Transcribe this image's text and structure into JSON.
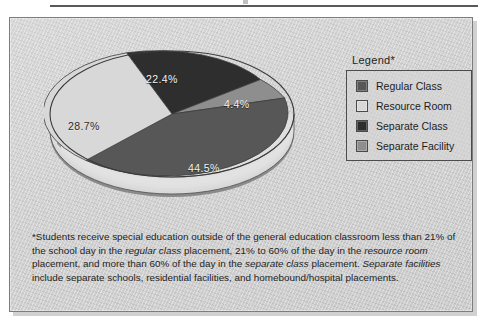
{
  "figure": {
    "legend_title": "Legend*",
    "caption_segments": [
      {
        "text": "*Students receive special education outside of the general education classroom less than 21% of the school day in the ",
        "italic": false
      },
      {
        "text": "regular class",
        "italic": true
      },
      {
        "text": " placement, 21% to 60% of the day in the ",
        "italic": false
      },
      {
        "text": "resource room",
        "italic": true
      },
      {
        "text": " placement, and more than 60% of the day in the ",
        "italic": false
      },
      {
        "text": "separate class",
        "italic": true
      },
      {
        "text": " placement. ",
        "italic": false
      },
      {
        "text": "Separate facilities",
        "italic": true
      },
      {
        "text": " include separate schools, residential facilities, and homebound/hospital placements.",
        "italic": false
      }
    ]
  },
  "chart_data": {
    "type": "pie",
    "title": "",
    "categories": [
      "Regular Class",
      "Resource Room",
      "Separate Class",
      "Separate Facility"
    ],
    "values": [
      44.5,
      28.7,
      22.4,
      4.4
    ],
    "value_labels": [
      "44.5%",
      "28.7%",
      "22.4%",
      "4.4%"
    ],
    "colors": [
      "#575757",
      "#d8d8d8",
      "#2e2e2e",
      "#8e8e8e"
    ],
    "label_text_colors": [
      "#f2f2f2",
      "#2b2b2b",
      "#f2f2f2",
      "#e8e8e8"
    ],
    "legend": [
      "Regular Class",
      "Resource Room",
      "Separate Class",
      "Separate Facility"
    ],
    "legend_position": "right",
    "three_d": true,
    "grid": false,
    "units": "percent"
  },
  "legend_items": [
    {
      "label": "Regular Class",
      "color": "#575757"
    },
    {
      "label": "Resource Room",
      "color": "#d8d8d8"
    },
    {
      "label": "Separate Class",
      "color": "#2e2e2e"
    },
    {
      "label": "Separate Facility",
      "color": "#8e8e8e"
    }
  ]
}
